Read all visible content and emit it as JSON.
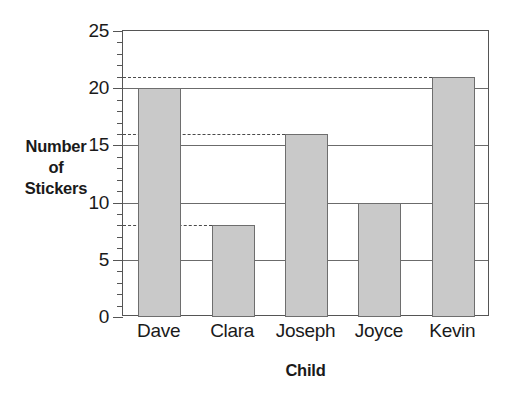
{
  "chart_data": {
    "type": "bar",
    "title": "",
    "xlabel": "Child",
    "ylabel": "Number of Stickers",
    "ylabel_lines": [
      "Number",
      "of",
      "Stickers"
    ],
    "categories": [
      "Dave",
      "Clara",
      "Joseph",
      "Joyce",
      "Kevin"
    ],
    "values": [
      20,
      8,
      16,
      10,
      21
    ],
    "ylim": [
      0,
      25
    ],
    "ytick_labels": [
      "0",
      "5",
      "10",
      "15",
      "20",
      "25"
    ],
    "ytick_values": [
      0,
      5,
      10,
      15,
      20,
      25
    ],
    "yminor_step": 1,
    "grid": "horizontal",
    "legend": "none",
    "bar_color": "#c9c9c9",
    "bar_edge_color": "#6e6e6e",
    "axis_color": "#555555",
    "gridline_color": "#6b6b6b",
    "reference_lines": [
      {
        "value": 21,
        "label": "21",
        "extent": "Kevin",
        "style": "dashed"
      },
      {
        "value": 16,
        "label": "16",
        "extent": "Joseph",
        "style": "dashed"
      },
      {
        "value": 8,
        "label": "8",
        "extent": "Clara",
        "style": "dashed"
      }
    ]
  }
}
